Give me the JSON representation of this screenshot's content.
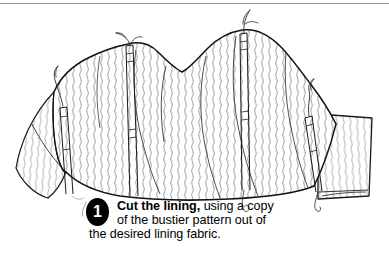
{
  "page": {
    "background_color": "#ffffff",
    "width": 389,
    "height": 262,
    "top_rule_color": "#9a9a9a"
  },
  "illustration": {
    "name": "bustier-lining-line-drawing",
    "description": "Line drawing of a bustier lining piece with sweetheart neckline, wavy fabric hatching, vertical boning channels with thread tails, and side tabs",
    "line_color": "#1a1a1a",
    "hatch_color": "#6f6f6f",
    "fill_color": "#ffffff"
  },
  "step": {
    "number": "1",
    "badge_color": "#000000",
    "badge_text_color": "#ffffff",
    "line1_bold": "Cut the lining,",
    "line1_rest": " using a copy",
    "line2": "of the bustier pattern out of",
    "line3": "the desired lining fabric.",
    "full_text": "Cut the lining, using a copy of the bustier pattern out of the desired lining fabric."
  }
}
